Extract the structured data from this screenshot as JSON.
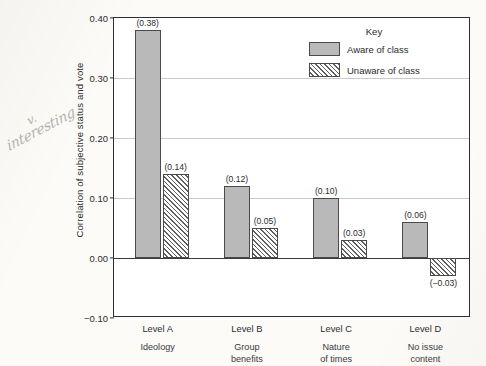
{
  "annotation": {
    "line1": "v.",
    "line2": "interesting"
  },
  "chart_data": {
    "type": "bar",
    "title": "",
    "xlabel": "",
    "ylabel": "Correlation of subjective status and vote",
    "ylim": [
      -0.1,
      0.4
    ],
    "yticks": [
      "0.40",
      "0.30",
      "0.20",
      "0.10",
      "0.00",
      "-0.10"
    ],
    "ytick_values": [
      0.4,
      0.3,
      0.2,
      0.1,
      0.0,
      -0.1
    ],
    "grid": true,
    "legend_position": "top-right",
    "legend_title": "Key",
    "categories": [
      "Level A",
      "Level B",
      "Level C",
      "Level D"
    ],
    "category_sublabels": [
      "Ideology",
      "Group benefits",
      "Nature of times",
      "No issue content"
    ],
    "category_sublabel_lines": [
      [
        "Ideology"
      ],
      [
        "Group",
        "benefits"
      ],
      [
        "Nature",
        "of times"
      ],
      [
        "No issue",
        "content"
      ]
    ],
    "series": [
      {
        "name": "Aware of class",
        "fill": "solid",
        "color": "#b9b9b9",
        "values": [
          0.38,
          0.12,
          0.1,
          0.06
        ],
        "labels": [
          "(0.38)",
          "(0.12)",
          "(0.10)",
          "(0.06)"
        ]
      },
      {
        "name": "Unaware of class",
        "fill": "hatched",
        "color": "#ffffff",
        "values": [
          0.14,
          0.05,
          0.03,
          -0.03
        ],
        "labels": [
          "(0.14)",
          "(0.05)",
          "(0.03)",
          "(−0.03)"
        ]
      }
    ]
  }
}
